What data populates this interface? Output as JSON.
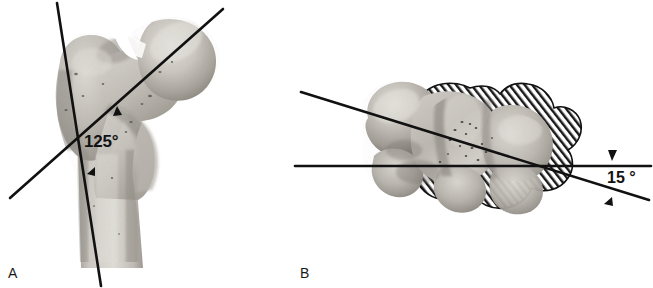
{
  "figure": {
    "caption_type": "anatomical-photograph-figure",
    "background_color": "#ffffff",
    "line_color": "#111111",
    "panels": [
      {
        "id": "A",
        "label": "A",
        "subject": "proximal femur, anterior view",
        "angle_label": "125°",
        "angle_value": 125,
        "angle_name": "femoral neck-shaft angle",
        "markers": [
          "arrowhead-upper",
          "arrowhead-lower"
        ],
        "lines": [
          {
            "name": "shaft-axis-line",
            "x1": 57,
            "y1": 3,
            "x2": 101,
            "y2": 286
          },
          {
            "name": "neck-axis-line",
            "x1": 10,
            "y1": 198,
            "x2": 223,
            "y2": 9
          }
        ]
      },
      {
        "id": "B",
        "label": "B",
        "subject": "distal femur superimposed on proximal femur, axial view",
        "angle_label": "15 °",
        "angle_value": 15,
        "angle_name": "femoral anteversion angle",
        "markers": [
          "arrowhead-upper",
          "arrowhead-lower"
        ],
        "lines": [
          {
            "name": "condylar-axis-line",
            "x1": 295,
            "y1": 166,
            "x2": 651,
            "y2": 166
          },
          {
            "name": "neck-axis-line",
            "x1": 301,
            "y1": 92,
            "x2": 649,
            "y2": 200
          }
        ]
      }
    ]
  },
  "colors": {
    "ink": "#111111",
    "paper": "#ffffff",
    "bone_light": "#d8d6d2",
    "bone_mid": "#b3b0aa",
    "bone_dark": "#8c8982",
    "bone_shadow": "#6d6a64",
    "hatch_line": "#1a1a1a"
  }
}
